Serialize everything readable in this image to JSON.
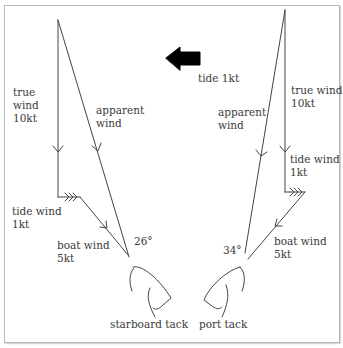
{
  "diagram": {
    "tide": {
      "label": "tide 1kt",
      "arrow_icon": "left-arrow-icon"
    },
    "left": {
      "true_wind": "true\nwind\n10kt",
      "apparent_wind": "apparent\nwind",
      "tide_wind": "tide wind\n1kt",
      "boat_wind": "boat wind\n5kt",
      "angle": "26°",
      "tack": "starboard tack"
    },
    "right": {
      "true_wind": "true wind\n10kt",
      "apparent_wind": "apparent\nwind",
      "tide_wind": "tide wind\n1kt",
      "boat_wind": "boat wind\n5kt",
      "angle": "34°",
      "tack": "port tack"
    },
    "colors": {
      "line": "#444444",
      "text": "#3a3a3a",
      "arrow": "#000000",
      "border": "#b8b8b8"
    }
  }
}
